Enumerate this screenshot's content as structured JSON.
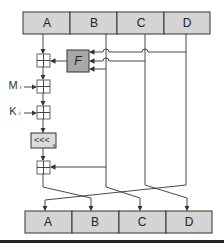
{
  "diagram": {
    "top_registers": [
      "A",
      "B",
      "C",
      "D"
    ],
    "bottom_registers": [
      "A",
      "B",
      "C",
      "D"
    ],
    "function_box": "F",
    "message_input": "M",
    "message_subscript": "i",
    "constant_input": "K",
    "constant_subscript": "i",
    "rotate_label": "<<<",
    "rotate_subscript": "s",
    "colors": {
      "register_fill": "#d4d4d4",
      "function_fill": "#a8a8a8",
      "line": "#333333",
      "background": "#ffffff"
    }
  }
}
